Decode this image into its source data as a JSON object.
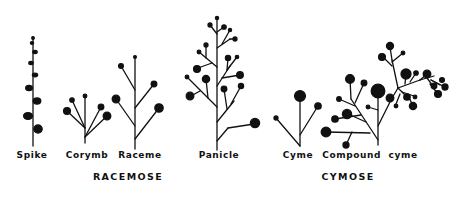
{
  "figure": {
    "type": "inflorescence-types-diagram",
    "ink_color": "#111111",
    "background": "#ffffff"
  },
  "inflorescences": [
    {
      "id": "spike",
      "label": "Spike",
      "group": "racemose",
      "label_x": 32
    },
    {
      "id": "corymb",
      "label": "Corymb",
      "group": "racemose",
      "label_x": 87
    },
    {
      "id": "raceme",
      "label": "Raceme",
      "group": "racemose",
      "label_x": 140
    },
    {
      "id": "panicle",
      "label": "Panicle",
      "group": "racemose",
      "label_x": 219
    },
    {
      "id": "cyme",
      "label": "Cyme",
      "group": "cymose",
      "label_x": 298
    },
    {
      "id": "compound-cyme",
      "label": "Compound  cyme",
      "group": "cymose",
      "label_x": 368
    }
  ],
  "groups": [
    {
      "id": "racemose",
      "label": "RACEMOSE",
      "label_x": 128
    },
    {
      "id": "cymose",
      "label": "CYMOSE",
      "label_x": 348
    }
  ]
}
